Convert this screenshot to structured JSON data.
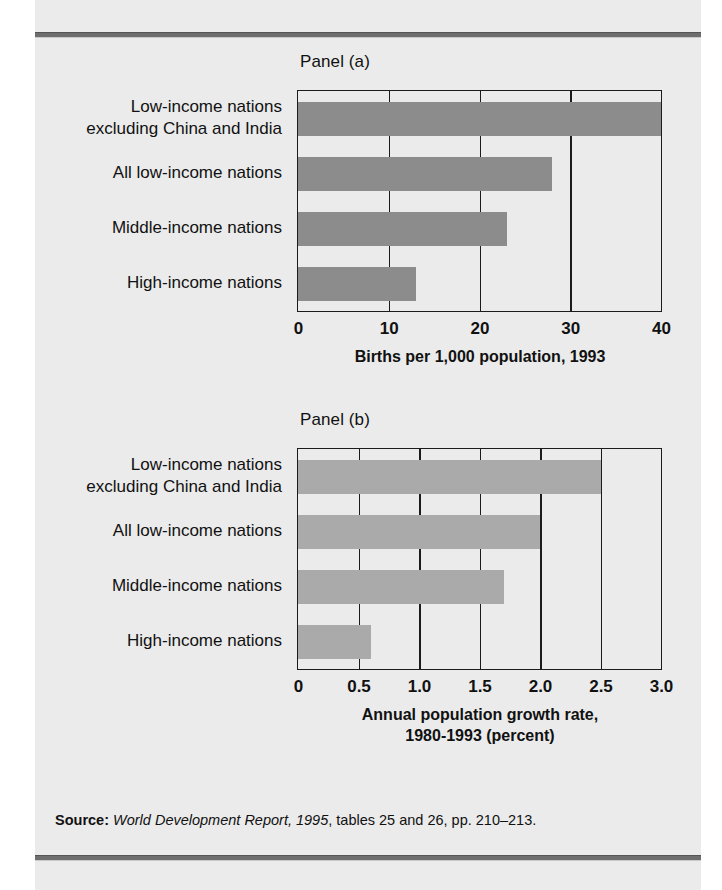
{
  "figure": {
    "background_color": "#ebebeb",
    "rule_color": "#6e6e6e"
  },
  "source": {
    "label": "Source:",
    "italic_part": "World Development Report, 1995",
    "rest": ", tables 25 and 26, pp. 210–213."
  },
  "chart_data": [
    {
      "type": "bar",
      "orientation": "horizontal",
      "title": "Panel (a)",
      "xlabel": "Births per 1,000 population, 1993",
      "ylabel": "",
      "xlim": [
        0,
        40
      ],
      "xticks": [
        0,
        10,
        20,
        30,
        40
      ],
      "xticklabels": [
        "0",
        "10",
        "20",
        "30",
        "40"
      ],
      "grid": true,
      "legend": "none",
      "bar_color": "#8c8c8c",
      "categories": [
        "Low-income nations\nexcluding China and India",
        "All low-income nations",
        "Middle-income nations",
        "High-income nations"
      ],
      "values": [
        40,
        28,
        23,
        13
      ]
    },
    {
      "type": "bar",
      "orientation": "horizontal",
      "title": "Panel (b)",
      "xlabel": "Annual population growth rate,\n1980-1993 (percent)",
      "ylabel": "",
      "xlim": [
        0,
        3.0
      ],
      "xticks": [
        0,
        0.5,
        1.0,
        1.5,
        2.0,
        2.5,
        3.0
      ],
      "xticklabels": [
        "0",
        "0.5",
        "1.0",
        "1.5",
        "2.0",
        "2.5",
        "3.0"
      ],
      "grid": true,
      "legend": "none",
      "bar_color": "#aaaaaa",
      "categories": [
        "Low-income nations\nexcluding China and India",
        "All low-income nations",
        "Middle-income nations",
        "High-income nations"
      ],
      "values": [
        2.5,
        2.0,
        1.7,
        0.6
      ]
    }
  ]
}
